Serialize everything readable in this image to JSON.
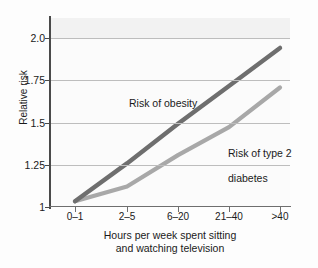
{
  "chart_data": {
    "type": "line",
    "title": "",
    "subtitle": "",
    "xlabel": "Hours per week spent sitting\nand watching television",
    "ylabel": "Relative risk",
    "categories": [
      "0–1",
      "2–5",
      "6–20",
      "21–40",
      ">40"
    ],
    "ytick_labels": [
      "1",
      "1.25",
      "1.5",
      "1.75",
      "2.0"
    ],
    "ytick_values": [
      1,
      1.25,
      1.5,
      1.75,
      2.0
    ],
    "ylim": [
      1.0,
      2.0
    ],
    "grid": "horizontal",
    "legend_position": "inline-annotations",
    "series": [
      {
        "name": "Risk of obesity",
        "color": "#6e6e6e",
        "values": [
          1.01,
          1.24,
          1.48,
          1.71,
          1.94
        ]
      },
      {
        "name": "Risk of type 2\ndiabetes",
        "color": "#a8a8a8",
        "values": [
          1.01,
          1.1,
          1.29,
          1.46,
          1.7
        ]
      }
    ],
    "annotations": [
      {
        "text": "Risk of obesity",
        "series": "Risk of obesity"
      },
      {
        "text": "Risk of type 2\ndiabetes",
        "series": "Risk of type 2 diabetes"
      }
    ]
  },
  "axis": {
    "y_title": "Relative risk",
    "x_title_line1": "Hours per week spent sitting",
    "x_title_line2": "and watching television",
    "y_ticks": [
      "1",
      "1.25",
      "1.5",
      "1.75",
      "2.0"
    ],
    "x_ticks": [
      "0–1",
      "2–5",
      "6–20",
      "21–40",
      ">40"
    ]
  },
  "labels": {
    "obesity": "Risk of obesity",
    "diabetes_line1": "Risk of type 2",
    "diabetes_line2": "diabetes"
  },
  "colors": {
    "obesity_line": "#6e6e6e",
    "diabetes_line": "#a8a8a8",
    "gridline": "#bdbdbd",
    "axis": "#4a4a4a",
    "text": "#1a1a1a",
    "plot_background": "#fbfbfb",
    "shade_band": "#f2f2f2"
  }
}
